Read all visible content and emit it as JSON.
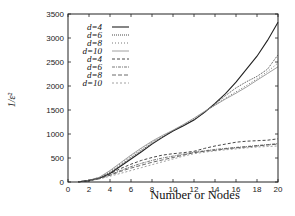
{
  "chart_data": {
    "type": "line",
    "title": "",
    "xlabel": "Number or Nodes",
    "ylabel": "1/ε²",
    "xlim": [
      0,
      20
    ],
    "ylim": [
      0,
      3500
    ],
    "xticks": [
      0,
      2,
      4,
      6,
      8,
      10,
      12,
      14,
      16,
      18,
      20
    ],
    "yticks": [
      0,
      500,
      1000,
      1500,
      2000,
      2500,
      3000,
      3500
    ],
    "grid": false,
    "legend_position": "upper-left",
    "x": [
      1,
      2,
      3,
      4,
      5,
      6,
      7,
      8,
      9,
      10,
      11,
      12,
      13,
      14,
      15,
      16,
      17,
      18,
      19,
      20
    ],
    "series": [
      {
        "name": "d=4",
        "style": "solid",
        "width": 1.1,
        "color": "#222222",
        "values": [
          5,
          30,
          80,
          180,
          330,
          480,
          630,
          790,
          930,
          1060,
          1170,
          1290,
          1450,
          1640,
          1840,
          2080,
          2350,
          2620,
          2950,
          3330
        ]
      },
      {
        "name": "d=6",
        "style": "dense-dot",
        "width": 0.9,
        "color": "#333333",
        "values": [
          5,
          30,
          85,
          200,
          350,
          510,
          660,
          810,
          940,
          1060,
          1180,
          1300,
          1450,
          1620,
          1800,
          1960,
          2090,
          2200,
          2350,
          2650
        ]
      },
      {
        "name": "d=8",
        "style": "dot",
        "width": 0.8,
        "color": "#555555",
        "values": [
          5,
          35,
          95,
          220,
          380,
          540,
          690,
          830,
          950,
          1070,
          1190,
          1320,
          1460,
          1600,
          1750,
          1880,
          2010,
          2150,
          2300,
          2480
        ]
      },
      {
        "name": "d=10",
        "style": "solid-light",
        "width": 0.8,
        "color": "#888888",
        "values": [
          5,
          35,
          100,
          240,
          400,
          560,
          710,
          850,
          970,
          1080,
          1200,
          1330,
          1470,
          1600,
          1730,
          1850,
          1980,
          2120,
          2260,
          2400
        ]
      },
      {
        "name": "d=4",
        "style": "dash",
        "width": 0.9,
        "color": "#333333",
        "values": [
          5,
          30,
          80,
          170,
          280,
          370,
          450,
          510,
          560,
          590,
          610,
          640,
          700,
          750,
          790,
          830,
          850,
          860,
          870,
          900
        ]
      },
      {
        "name": "d=6",
        "style": "dot-dash",
        "width": 0.8,
        "color": "#555555",
        "values": [
          5,
          30,
          75,
          150,
          240,
          320,
          390,
          450,
          500,
          540,
          580,
          620,
          650,
          680,
          700,
          720,
          740,
          760,
          780,
          800
        ]
      },
      {
        "name": "d=8",
        "style": "long-dash",
        "width": 0.8,
        "color": "#444444",
        "values": [
          5,
          30,
          70,
          140,
          220,
          290,
          350,
          410,
          460,
          510,
          560,
          610,
          640,
          660,
          690,
          710,
          730,
          750,
          770,
          790
        ]
      },
      {
        "name": "d=10",
        "style": "dash-light",
        "width": 0.8,
        "color": "#888888",
        "values": [
          5,
          25,
          65,
          120,
          180,
          240,
          300,
          360,
          420,
          480,
          540,
          590,
          620,
          650,
          670,
          690,
          710,
          730,
          740,
          750
        ]
      }
    ]
  }
}
